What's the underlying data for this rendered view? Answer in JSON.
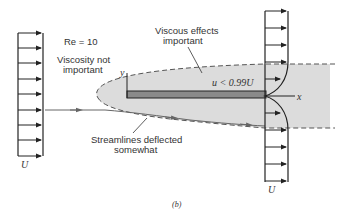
{
  "figure": {
    "caption": "(b)",
    "reynolds_label": "Re =  10",
    "annotations": {
      "viscosity_not_important": [
        "Viscosity not",
        "important"
      ],
      "viscous_effects_important": [
        "Viscous effects",
        "important"
      ],
      "streamlines_deflected": [
        "Streamlines deflected",
        "somewhat"
      ],
      "velocity_condition": "u < 0.99U"
    },
    "axes": {
      "x": "x",
      "y": "y"
    },
    "freestream_labels": {
      "left": "U",
      "right": "U"
    },
    "colors": {
      "shaded_region": "#dcdcdc",
      "plate": "#8a8a8a",
      "lines": "#222222",
      "streamline": "#666666"
    }
  }
}
